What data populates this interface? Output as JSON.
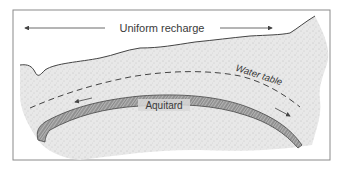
{
  "diagram": {
    "labels": {
      "recharge": "Uniform recharge",
      "water_table": "Water table",
      "aquitard": "Aquitard"
    },
    "colors": {
      "frame": "#8a8a8a",
      "aquifer_fill": "#e6e6e6",
      "stipple": "#9a9a9a",
      "aquitard_fill": "#a8a8a8",
      "aquitard_hatch": "#555555",
      "line": "#444444",
      "text": "#3a3a3a"
    },
    "icons": {
      "recharge_left_arrow": "arrow-left",
      "recharge_right_arrow": "arrow-right",
      "flow_left_arrow": "arrow-left",
      "flow_right_arrow": "arrow-down-right"
    }
  }
}
